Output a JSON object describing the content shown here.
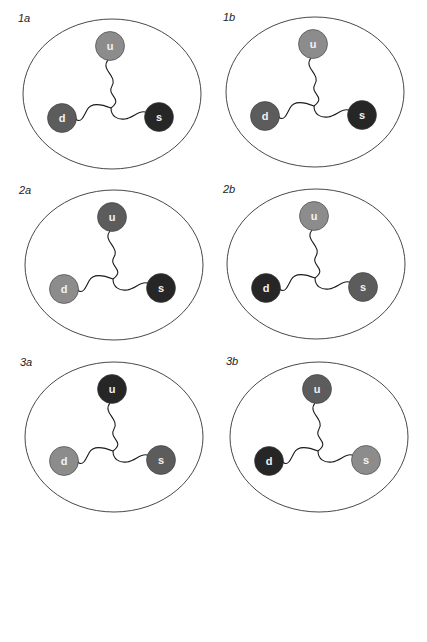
{
  "colors": {
    "light": "#8c8c8c",
    "medium": "#5c5c5c",
    "dark": "#262626",
    "outline": "#333333",
    "gluon": "#1a1a1a"
  },
  "panels": [
    {
      "label": "1a",
      "x": 22,
      "y": 18,
      "labelX": 18,
      "labelY": 12,
      "quarks": {
        "u": {
          "letter": "u",
          "shade": "light"
        },
        "d": {
          "letter": "d",
          "shade": "medium"
        },
        "s": {
          "letter": "s",
          "shade": "dark"
        }
      }
    },
    {
      "label": "1b",
      "x": 225,
      "y": 16,
      "labelX": 223,
      "labelY": 11,
      "quarks": {
        "u": {
          "letter": "u",
          "shade": "light"
        },
        "d": {
          "letter": "d",
          "shade": "medium"
        },
        "s": {
          "letter": "s",
          "shade": "dark"
        }
      }
    },
    {
      "label": "2a",
      "x": 24,
      "y": 189,
      "labelX": 19,
      "labelY": 184,
      "quarks": {
        "u": {
          "letter": "u",
          "shade": "medium"
        },
        "d": {
          "letter": "d",
          "shade": "light"
        },
        "s": {
          "letter": "s",
          "shade": "dark"
        }
      }
    },
    {
      "label": "2b",
      "x": 226,
      "y": 188,
      "labelX": 223,
      "labelY": 183,
      "quarks": {
        "u": {
          "letter": "u",
          "shade": "light"
        },
        "d": {
          "letter": "d",
          "shade": "dark"
        },
        "s": {
          "letter": "s",
          "shade": "medium"
        }
      }
    },
    {
      "label": "3a",
      "x": 24,
      "y": 361,
      "labelX": 20,
      "labelY": 356,
      "quarks": {
        "u": {
          "letter": "u",
          "shade": "dark"
        },
        "d": {
          "letter": "d",
          "shade": "light"
        },
        "s": {
          "letter": "s",
          "shade": "medium"
        }
      }
    },
    {
      "label": "3b",
      "x": 229,
      "y": 361,
      "labelX": 226,
      "labelY": 355,
      "quarks": {
        "u": {
          "letter": "u",
          "shade": "medium"
        },
        "d": {
          "letter": "d",
          "shade": "dark"
        },
        "s": {
          "letter": "s",
          "shade": "light"
        }
      }
    }
  ]
}
